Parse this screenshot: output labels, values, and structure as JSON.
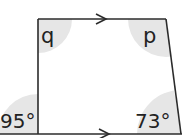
{
  "diagram": {
    "type": "trapezium",
    "parallel_marker": "arrow",
    "colors": {
      "line": "#2b2b2b",
      "shade": "#e6e6e6",
      "text": "#222222",
      "background": "#ffffff"
    },
    "angles": [
      {
        "id": "q",
        "label": "q",
        "position": "top-left"
      },
      {
        "id": "p",
        "label": "p",
        "position": "top-right"
      },
      {
        "id": "exterior_left",
        "label": "95°",
        "position": "bottom-left-exterior"
      },
      {
        "id": "bottom_right",
        "label": "73°",
        "position": "bottom-right"
      }
    ]
  }
}
